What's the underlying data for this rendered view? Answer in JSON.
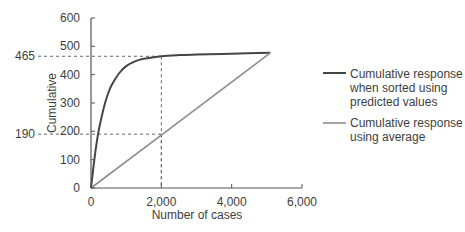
{
  "chart_data": {
    "type": "line",
    "title": "",
    "xlabel": "Number of cases",
    "ylabel": "Cumulative",
    "xlim": [
      0,
      6000
    ],
    "ylim": [
      0,
      600
    ],
    "x_ticks": [
      0,
      2000,
      4000,
      6000
    ],
    "x_tick_labels": [
      "0",
      "2,000",
      "4,000",
      "6,000"
    ],
    "y_ticks": [
      0,
      100,
      200,
      300,
      400,
      500,
      600
    ],
    "y_tick_labels": [
      "0",
      "100",
      "200",
      "300",
      "400",
      "500",
      "600"
    ],
    "grid": false,
    "legend_position": "right",
    "series": [
      {
        "name": "Cumulative response when sorted using predicted values",
        "legend_lines": [
          "Cumulative response",
          "when sorted using",
          "predicted values"
        ],
        "color": "#454545",
        "x": [
          0,
          100,
          200,
          300,
          400,
          500,
          600,
          800,
          1000,
          1250,
          1500,
          2000,
          2500,
          3000,
          4000,
          5100
        ],
        "y": [
          0,
          105,
          190,
          250,
          300,
          338,
          366,
          405,
          430,
          447,
          456,
          465,
          469,
          471,
          474,
          477
        ]
      },
      {
        "name": "Cumulative response using average",
        "legend_lines": [
          "Cumulative response",
          "using average"
        ],
        "color": "#8c8c8c",
        "x": [
          0,
          2000,
          5100
        ],
        "y": [
          0,
          187,
          477
        ]
      }
    ],
    "annotations": [
      {
        "type": "reference",
        "x": 2000,
        "y": 465,
        "label": "465"
      },
      {
        "type": "reference",
        "x": 2000,
        "y": 190,
        "label": "190"
      }
    ]
  }
}
